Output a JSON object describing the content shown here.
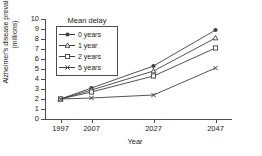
{
  "chart_data": {
    "type": "line",
    "title": "",
    "xlabel": "Year",
    "ylabel": "Alzheimer's disease prevalence\n(millions)",
    "categories": [
      "1997",
      "2007",
      "2027",
      "2047"
    ],
    "x": [
      1997,
      2007,
      2027,
      2047
    ],
    "xlim": [
      1992,
      2052
    ],
    "ylim": [
      0,
      10
    ],
    "yticks": [
      "0",
      "1",
      "2",
      "3",
      "4",
      "5",
      "6",
      "7",
      "8",
      "9",
      "10"
    ],
    "ytick_values": [
      0,
      1,
      2,
      3,
      4,
      5,
      6,
      7,
      8,
      9,
      10
    ],
    "grid": false,
    "legend_position": "upper-left-inside",
    "legend_title": "Mean delay",
    "series": [
      {
        "name": "0 years",
        "marker": "circle",
        "color": "#404040",
        "values": [
          2.0,
          3.1,
          5.3,
          8.9
        ]
      },
      {
        "name": "1 year",
        "marker": "triangle",
        "color": "#404040",
        "values": [
          2.0,
          2.9,
          4.8,
          8.1
        ]
      },
      {
        "name": "2 years",
        "marker": "square",
        "color": "#404040",
        "values": [
          2.0,
          2.7,
          4.3,
          7.1
        ]
      },
      {
        "name": "5 years",
        "marker": "x",
        "color": "#404040",
        "values": [
          2.0,
          2.1,
          2.4,
          5.1
        ]
      }
    ]
  },
  "legend": {
    "title": "Mean delay",
    "items": [
      {
        "label": "0 years",
        "marker": "circle-marker-icon"
      },
      {
        "label": "1 year",
        "marker": "triangle-marker-icon"
      },
      {
        "label": "2 years",
        "marker": "square-marker-icon"
      },
      {
        "label": "5 years",
        "marker": "x-marker-icon"
      }
    ]
  },
  "axes": {
    "y_title_line1": "Alzheimer's disease prevalence",
    "y_title_line2": "(millions)",
    "x_title": "Year",
    "y_ticks": [
      "10",
      "9",
      "8",
      "7",
      "6",
      "5",
      "4",
      "3",
      "2",
      "1",
      "0"
    ],
    "x_ticks": [
      "1997",
      "2007",
      "2027",
      "2047"
    ]
  },
  "colors": {
    "line": "#404040",
    "axis": "#4d4d4d",
    "text": "#1a1a1a",
    "background": "#ffffff"
  }
}
